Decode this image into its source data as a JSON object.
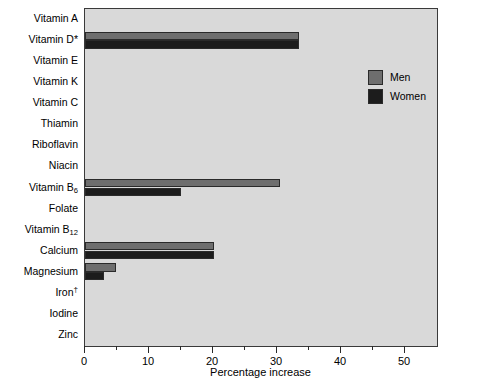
{
  "chart_data": {
    "type": "bar",
    "orientation": "horizontal",
    "title": "",
    "xlabel": "Percentage increase",
    "ylabel": "",
    "xlim": [
      0,
      55
    ],
    "xticks": [
      0,
      5,
      10,
      15,
      20,
      25,
      30,
      35,
      40,
      45,
      50
    ],
    "xtick_labels": [
      "0",
      "",
      "10",
      "",
      "20",
      "",
      "30",
      "",
      "40",
      "",
      "50"
    ],
    "grid": false,
    "legend_position": "upper right",
    "categories": [
      "Vitamin A",
      "Vitamin D*",
      "Vitamin E",
      "Vitamin K",
      "Vitamin C",
      "Thiamin",
      "Riboflavin",
      "Niacin",
      "Vitamin B6",
      "Folate",
      "Vitamin B12",
      "Calcium",
      "Magnesium",
      "Iron†",
      "Iodine",
      "Zinc"
    ],
    "categories_html": [
      "Vitamin A",
      "Vitamin D*",
      "Vitamin E",
      "Vitamin K",
      "Vitamin C",
      "Thiamin",
      "Riboflavin",
      "Niacin",
      "Vitamin B<sub>6</sub>",
      "Folate",
      "Vitamin B<sub>12</sub>",
      "Calcium",
      "Magnesium",
      "Iron<sup>†</sup>",
      "Iodine",
      "Zinc"
    ],
    "series": [
      {
        "name": "Men",
        "color": "#6e6e6e",
        "values": [
          0,
          33.5,
          0,
          0,
          0,
          0,
          0,
          0,
          30.4,
          0,
          0,
          20.2,
          4.8,
          0,
          0,
          0
        ]
      },
      {
        "name": "Women",
        "color": "#1c1c1c",
        "values": [
          0,
          33.5,
          0,
          0,
          0,
          0,
          0,
          0,
          15.0,
          0,
          0,
          20.2,
          3.0,
          0,
          0,
          0
        ]
      }
    ]
  },
  "legend": {
    "entries": [
      {
        "label": "Men",
        "color": "#6e6e6e"
      },
      {
        "label": "Women",
        "color": "#1c1c1c"
      }
    ]
  },
  "axis": {
    "x_title": "Percentage increase"
  },
  "colors": {
    "plot_background": "#d9d9d9",
    "frame": "#3a3a3a",
    "men": "#6e6e6e",
    "women": "#1c1c1c",
    "text": "#000000"
  }
}
